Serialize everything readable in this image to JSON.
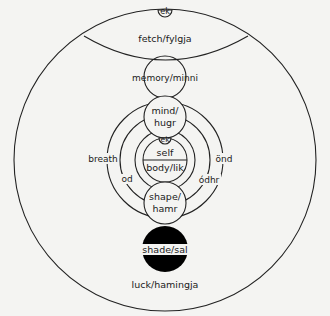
{
  "diagram": {
    "type": "nested-circles",
    "labels": {
      "ek_top": "ek",
      "fetch": "fetch/fylgja",
      "memory": "memory/minni",
      "mind_line1": "mind/",
      "mind_line2": "hugr",
      "ek_self": "ek",
      "self": "self",
      "body": "body/lik",
      "breath": "breath",
      "od": "od",
      "ond": "önd",
      "odhr": "ódhr",
      "shape_line1": "shape/",
      "shape_line2": "hamr",
      "shade": "shade/sal",
      "luck": "luck/hamingja"
    },
    "colors": {
      "line": "#222222",
      "background": "#f4f4f2",
      "shade_fill": "#000000"
    }
  }
}
